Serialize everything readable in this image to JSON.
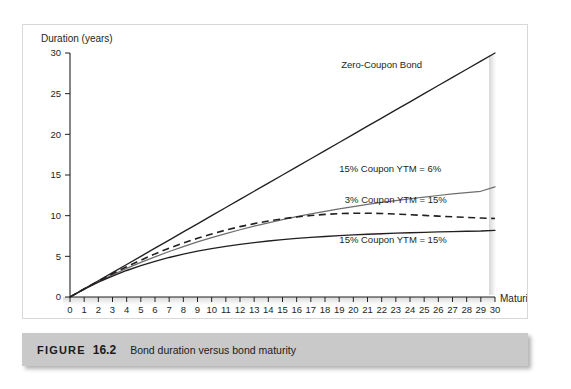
{
  "figure": {
    "caption_word": "FIGURE",
    "caption_number": "16.2",
    "caption_text": "Bond duration versus bond maturity"
  },
  "chart_data": {
    "type": "line",
    "title": "Bond duration versus bond maturity",
    "xlabel": "Maturity",
    "ylabel": "Duration (years)",
    "xlim": [
      0,
      30
    ],
    "ylim": [
      0,
      30
    ],
    "xticks": [
      0,
      1,
      2,
      3,
      4,
      5,
      6,
      7,
      8,
      9,
      10,
      11,
      12,
      13,
      14,
      15,
      16,
      17,
      18,
      19,
      20,
      21,
      22,
      23,
      24,
      25,
      26,
      27,
      28,
      29,
      30
    ],
    "xtick_labels": [
      "0",
      "1",
      "2",
      "3",
      "4",
      "5",
      "6",
      "7",
      "8",
      "9",
      "10",
      "11",
      "12",
      "13",
      "14",
      "15",
      "16",
      "17",
      "18",
      "19",
      "20",
      "21",
      "22",
      "23",
      "24",
      "25",
      "26",
      "27",
      "28",
      "29",
      "30"
    ],
    "yticks": [
      0,
      5,
      10,
      15,
      20,
      25,
      30
    ],
    "ytick_labels": [
      "0",
      "5",
      "10",
      "15",
      "20",
      "25",
      "30"
    ],
    "grid": false,
    "legend_position": "inline-annotations",
    "x": [
      0,
      1,
      2,
      3,
      4,
      5,
      6,
      7,
      8,
      9,
      10,
      11,
      12,
      13,
      14,
      15,
      16,
      17,
      18,
      19,
      20,
      21,
      22,
      23,
      24,
      25,
      26,
      27,
      28,
      29,
      30
    ],
    "series": [
      {
        "name": "Zero-Coupon Bond",
        "style": "solid",
        "color": "#231f20",
        "label_text": "Zero-Coupon Bond",
        "values": [
          0,
          1,
          2,
          3,
          4,
          5,
          6,
          7,
          8,
          9,
          10,
          11,
          12,
          13,
          14,
          15,
          16,
          17,
          18,
          19,
          20,
          21,
          22,
          23,
          24,
          25,
          26,
          27,
          28,
          29,
          30
        ]
      },
      {
        "name": "15% Coupon YTM = 6%",
        "style": "solid",
        "color": "#6e6e70",
        "label_text": "15% Coupon YTM = 6%",
        "values": [
          0,
          0.97,
          1.87,
          2.72,
          3.51,
          4.25,
          4.94,
          5.59,
          6.2,
          6.77,
          7.3,
          7.8,
          8.27,
          8.71,
          9.12,
          9.51,
          9.87,
          10.21,
          10.53,
          10.83,
          11.11,
          11.38,
          11.63,
          11.86,
          12.08,
          12.29,
          12.48,
          12.67,
          12.84,
          13.0,
          13.55
        ]
      },
      {
        "name": "3% Coupon YTM = 15%",
        "style": "dashed",
        "color": "#231f20",
        "label_text": "3% Coupon YTM = 15%",
        "values": [
          0,
          0.99,
          1.95,
          2.86,
          3.72,
          4.53,
          5.3,
          6.0,
          6.64,
          7.22,
          7.75,
          8.23,
          8.65,
          9.02,
          9.34,
          9.61,
          9.84,
          10.02,
          10.16,
          10.25,
          10.3,
          10.3,
          10.27,
          10.2,
          10.12,
          10.03,
          9.94,
          9.86,
          9.78,
          9.71,
          9.65
        ]
      },
      {
        "name": "15% Coupon YTM = 15%",
        "style": "solid",
        "color": "#231f20",
        "label_text": "15% Coupon YTM = 15%",
        "values": [
          0,
          0.96,
          1.82,
          2.58,
          3.26,
          3.86,
          4.39,
          4.86,
          5.27,
          5.63,
          5.95,
          6.23,
          6.48,
          6.69,
          6.88,
          7.05,
          7.2,
          7.33,
          7.44,
          7.54,
          7.63,
          7.71,
          7.78,
          7.85,
          7.9,
          7.95,
          8.0,
          8.04,
          8.08,
          8.11,
          8.2
        ]
      }
    ],
    "annotations": [
      {
        "text": "Zero-Coupon Bond",
        "x": 22.0,
        "y": 28.1
      },
      {
        "text": "15% Coupon YTM = 6%",
        "x": 22.6,
        "y": 15.4
      },
      {
        "text": "3% Coupon YTM = 15%",
        "x": 23.0,
        "y": 11.5
      },
      {
        "text": "15% Coupon YTM = 15%",
        "x": 22.8,
        "y": 6.6
      }
    ]
  }
}
